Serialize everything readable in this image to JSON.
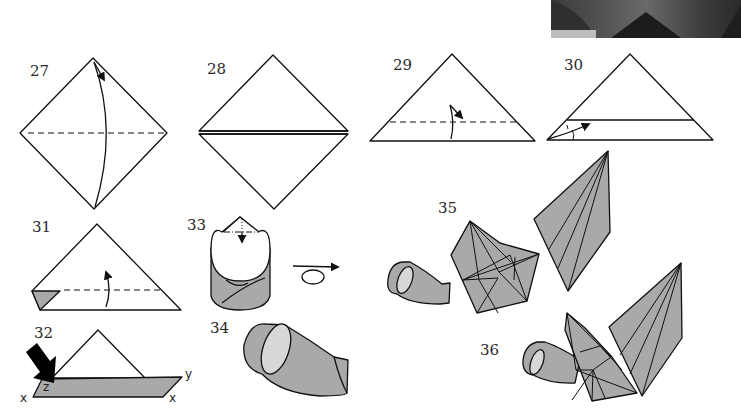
{
  "figure": {
    "type": "origami folding diagram",
    "photo": {
      "description": "cropped photograph of folded paper model (top-right corner)"
    },
    "colors": {
      "line": "#111111",
      "paper_gray": "#a9a9a9",
      "inner_light": "#d8d8d8",
      "background": "#ffffff"
    },
    "steps": [
      {
        "number": "27",
        "shape": "square diamond",
        "marks": [
          "horizontal dashed valley fold",
          "curved fold arrow top to bottom"
        ]
      },
      {
        "number": "28",
        "shape": "square diamond",
        "marks": [
          "horizontal double line (folded edge)"
        ]
      },
      {
        "number": "29",
        "shape": "triangle",
        "marks": [
          "horizontal dashed fold line",
          "fold arrow up"
        ]
      },
      {
        "number": "30",
        "shape": "triangle",
        "marks": [
          "folded strip line",
          "curved arrow"
        ]
      },
      {
        "number": "31",
        "shape": "triangle",
        "marks": [
          "dashed fold line",
          "gray corner flap",
          "fold arrow up"
        ]
      },
      {
        "number": "32",
        "shape": "triangle with gray strip",
        "marks": [
          "black push arrow"
        ],
        "point_labels": [
          "z",
          "y",
          "x",
          "x"
        ]
      },
      {
        "number": "33",
        "shape": "rolled cylinder",
        "marks": [
          "dash-dot fold line",
          "arrow",
          "turn-over symbol"
        ]
      },
      {
        "number": "34",
        "shape": "cone / horn"
      },
      {
        "number": "35",
        "shape": "separate parts: horn, pentagon body, kite wing"
      },
      {
        "number": "36",
        "shape": "assembled model: horn + body + wing"
      }
    ]
  }
}
